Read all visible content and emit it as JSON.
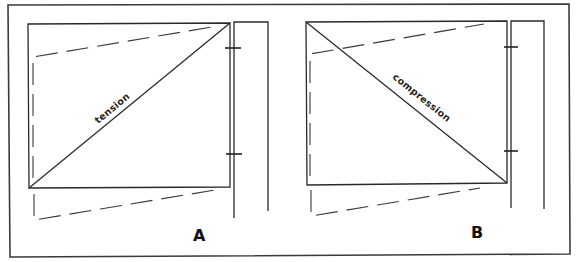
{
  "figure": {
    "panels": [
      {
        "id": "A",
        "letter": "A",
        "brace_label": "tension",
        "diagonal_direction": "bottom-left to top-right"
      },
      {
        "id": "B",
        "letter": "B",
        "brace_label": "compression",
        "diagonal_direction": "top-left to bottom-right"
      }
    ],
    "colors": {
      "line": "#2a2a2a",
      "background": "#ffffff"
    }
  }
}
